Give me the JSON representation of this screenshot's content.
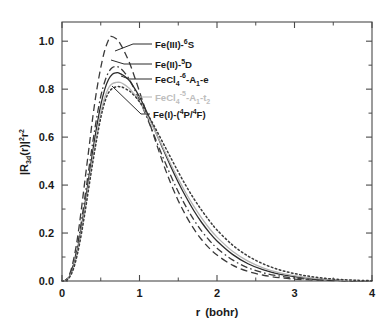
{
  "chart_data": {
    "type": "line",
    "title": "",
    "subtitle": "",
    "xlabel": "r  (bohr)",
    "ylabel": "|R3d(r)|²r²",
    "xlabel_parts": {
      "symbol": "r",
      "unit": "(bohr)"
    },
    "ylabel_parts": {
      "pre": "|R",
      "sub1": "3d",
      "mid": "(r)|",
      "sup1": "2",
      "post": "r",
      "sup2": "2"
    },
    "xlim": [
      0,
      4
    ],
    "ylim": [
      0,
      1.08
    ],
    "xticks": [
      0,
      1,
      2,
      3,
      4
    ],
    "xtick_labels": [
      "0",
      "1",
      "2",
      "3",
      "4"
    ],
    "yticks": [
      0.0,
      0.2,
      0.4,
      0.6,
      0.8,
      1.0
    ],
    "ytick_labels": [
      "0.0",
      "0.2",
      "0.4",
      "0.6",
      "0.8",
      "1.0"
    ],
    "x_minor_ticks": [
      0.5,
      1.5,
      2.5,
      3.5
    ],
    "y_minor_ticks": [
      0.1,
      0.3,
      0.5,
      0.7,
      0.9
    ],
    "grid": false,
    "legend_position": "inside-upper-right-with-leader-lines",
    "series": [
      {
        "name": "Fe(III)-6S",
        "label_parts": {
          "pre": "Fe(III)-",
          "sup": "6",
          "post": "S"
        },
        "linestyle": "dashed",
        "color": "#3a3a3a",
        "peak_r": 0.63,
        "peak_value": 1.02,
        "x": [
          0.0,
          0.05,
          0.1,
          0.15,
          0.2,
          0.25,
          0.3,
          0.35,
          0.4,
          0.45,
          0.5,
          0.55,
          0.6,
          0.63,
          0.7,
          0.75,
          0.8,
          0.85,
          0.9,
          1.0,
          1.1,
          1.2,
          1.3,
          1.4,
          1.5,
          1.6,
          1.7,
          1.8,
          1.9,
          2.0,
          2.2,
          2.4,
          2.6,
          2.8,
          3.0,
          3.2,
          3.4,
          3.6,
          3.8,
          4.0
        ],
        "y": [
          0.0,
          0.004,
          0.03,
          0.09,
          0.18,
          0.3,
          0.43,
          0.56,
          0.69,
          0.8,
          0.89,
          0.96,
          1.005,
          1.02,
          1.01,
          0.99,
          0.96,
          0.925,
          0.885,
          0.79,
          0.69,
          0.59,
          0.495,
          0.41,
          0.335,
          0.272,
          0.218,
          0.173,
          0.137,
          0.108,
          0.066,
          0.04,
          0.024,
          0.014,
          0.008,
          0.0045,
          0.0025,
          0.0013,
          0.0006,
          0.0002
        ]
      },
      {
        "name": "Fe(II)-5D",
        "label_parts": {
          "pre": "Fe(II)-",
          "sup": "5",
          "post": "D"
        },
        "linestyle": "dash-dot",
        "color": "#3a3a3a",
        "peak_r": 0.7,
        "peak_value": 0.895,
        "x": [
          0.0,
          0.05,
          0.1,
          0.15,
          0.2,
          0.25,
          0.3,
          0.35,
          0.4,
          0.45,
          0.5,
          0.55,
          0.6,
          0.65,
          0.7,
          0.75,
          0.8,
          0.85,
          0.9,
          1.0,
          1.1,
          1.2,
          1.3,
          1.4,
          1.5,
          1.6,
          1.7,
          1.8,
          1.9,
          2.0,
          2.2,
          2.4,
          2.6,
          2.8,
          3.0,
          3.2,
          3.4,
          3.6,
          3.8,
          4.0
        ],
        "y": [
          0.0,
          0.003,
          0.024,
          0.072,
          0.148,
          0.248,
          0.36,
          0.475,
          0.585,
          0.685,
          0.77,
          0.83,
          0.87,
          0.89,
          0.895,
          0.888,
          0.872,
          0.85,
          0.822,
          0.755,
          0.678,
          0.598,
          0.518,
          0.442,
          0.372,
          0.31,
          0.256,
          0.209,
          0.17,
          0.137,
          0.088,
          0.055,
          0.034,
          0.021,
          0.012,
          0.007,
          0.004,
          0.002,
          0.001,
          0.0004
        ]
      },
      {
        "name": "FeCl4-6-A1-e",
        "label_parts": {
          "pre": "FeCl",
          "sub": "4",
          "sup": "-6",
          "mid": "-A",
          "sub2": "1",
          "post": "-e"
        },
        "linestyle": "solid",
        "color": "#2b2b2b",
        "peak_r": 0.73,
        "peak_value": 0.868,
        "x": [
          0.0,
          0.05,
          0.1,
          0.15,
          0.2,
          0.25,
          0.3,
          0.35,
          0.4,
          0.45,
          0.5,
          0.55,
          0.6,
          0.65,
          0.7,
          0.73,
          0.8,
          0.85,
          0.9,
          1.0,
          1.1,
          1.2,
          1.3,
          1.4,
          1.5,
          1.6,
          1.7,
          1.8,
          1.9,
          2.0,
          2.2,
          2.4,
          2.6,
          2.8,
          3.0,
          3.2,
          3.4,
          3.6,
          3.8,
          4.0
        ],
        "y": [
          0.0,
          0.003,
          0.021,
          0.064,
          0.133,
          0.224,
          0.33,
          0.44,
          0.548,
          0.647,
          0.733,
          0.798,
          0.84,
          0.862,
          0.868,
          0.868,
          0.856,
          0.842,
          0.822,
          0.768,
          0.7,
          0.628,
          0.553,
          0.48,
          0.412,
          0.35,
          0.294,
          0.245,
          0.203,
          0.167,
          0.111,
          0.072,
          0.046,
          0.029,
          0.018,
          0.011,
          0.006,
          0.003,
          0.0015,
          0.0006
        ]
      },
      {
        "name": "FeCl4-5-A1-t2",
        "label_parts": {
          "pre": "FeCl",
          "sub": "4",
          "sup": "-5",
          "mid": "-A",
          "sub2": "1",
          "post": "-t",
          "sub3": "2"
        },
        "linestyle": "solid",
        "color": "#b5b5b5",
        "peak_r": 0.75,
        "peak_value": 0.828,
        "x": [
          0.0,
          0.05,
          0.1,
          0.15,
          0.2,
          0.25,
          0.3,
          0.35,
          0.4,
          0.45,
          0.5,
          0.55,
          0.6,
          0.65,
          0.7,
          0.75,
          0.8,
          0.85,
          0.9,
          1.0,
          1.1,
          1.2,
          1.3,
          1.4,
          1.5,
          1.6,
          1.7,
          1.8,
          1.9,
          2.0,
          2.2,
          2.4,
          2.6,
          2.8,
          3.0,
          3.2,
          3.4,
          3.6,
          3.8,
          4.0
        ],
        "y": [
          0.0,
          0.002,
          0.019,
          0.058,
          0.123,
          0.209,
          0.31,
          0.417,
          0.52,
          0.616,
          0.7,
          0.764,
          0.805,
          0.823,
          0.828,
          0.828,
          0.82,
          0.808,
          0.792,
          0.748,
          0.69,
          0.625,
          0.558,
          0.49,
          0.426,
          0.366,
          0.312,
          0.263,
          0.22,
          0.183,
          0.124,
          0.083,
          0.054,
          0.035,
          0.022,
          0.013,
          0.008,
          0.004,
          0.002,
          0.0008
        ]
      },
      {
        "name": "Fe(I)-(4P/4F)",
        "label_parts": {
          "pre": "Fe(I)-(",
          "sup1": "4",
          "mid1": "P/",
          "sup2": "4",
          "post": "F)"
        },
        "linestyle": "dotted",
        "color": "#3a3a3a",
        "peak_r": 0.78,
        "peak_value": 0.81,
        "x": [
          0.0,
          0.05,
          0.1,
          0.15,
          0.2,
          0.25,
          0.3,
          0.35,
          0.4,
          0.45,
          0.5,
          0.55,
          0.6,
          0.65,
          0.7,
          0.75,
          0.78,
          0.85,
          0.9,
          1.0,
          1.1,
          1.2,
          1.3,
          1.4,
          1.5,
          1.6,
          1.7,
          1.8,
          1.9,
          2.0,
          2.2,
          2.4,
          2.6,
          2.8,
          3.0,
          3.2,
          3.4,
          3.6,
          3.8,
          4.0
        ],
        "y": [
          0.0,
          0.002,
          0.017,
          0.053,
          0.114,
          0.196,
          0.293,
          0.398,
          0.5,
          0.595,
          0.68,
          0.745,
          0.785,
          0.803,
          0.81,
          0.81,
          0.808,
          0.796,
          0.784,
          0.748,
          0.698,
          0.64,
          0.578,
          0.516,
          0.455,
          0.397,
          0.344,
          0.296,
          0.252,
          0.213,
          0.15,
          0.104,
          0.071,
          0.047,
          0.031,
          0.019,
          0.011,
          0.006,
          0.003,
          0.0012
        ]
      }
    ],
    "annotations": [
      {
        "text": "Fe(III)-6S",
        "series_index": 0
      },
      {
        "text": "Fe(II)-5D",
        "series_index": 1
      },
      {
        "text": "FeCl4-6-A1-e",
        "series_index": 2
      },
      {
        "text": "FeCl4-5-A1-t2",
        "series_index": 3
      },
      {
        "text": "Fe(I)-(4P/4F)",
        "series_index": 4
      }
    ]
  },
  "colors": {
    "axis": "#4a4a4a",
    "text": "#1a1a1a",
    "faint_series": "#b5b5b5",
    "background": "#ffffff"
  }
}
